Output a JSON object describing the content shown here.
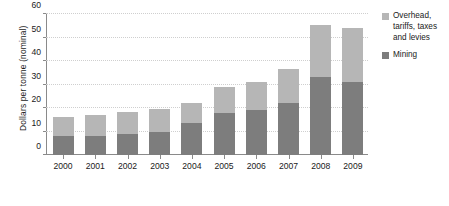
{
  "chart_data": {
    "type": "bar",
    "subtype": "stacked-vertical",
    "title": "",
    "xlabel": "",
    "ylabel": "Dollars per tonne (nominal)",
    "ylim": [
      0,
      60
    ],
    "yticks": [
      0,
      10,
      20,
      30,
      40,
      50,
      60
    ],
    "ytick_labels": [
      "0",
      "10",
      "20",
      "30",
      "40",
      "50",
      "60"
    ],
    "grid": "horizontal-dotted",
    "legend_position": "right",
    "categories": [
      "2000",
      "2001",
      "2002",
      "2003",
      "2004",
      "2005",
      "2006",
      "2007",
      "2008",
      "2009"
    ],
    "series": [
      {
        "name": "Mining",
        "color": "#7d7d7d",
        "values": [
          8,
          8,
          9,
          10,
          13.5,
          18,
          19,
          22,
          33,
          31
        ]
      },
      {
        "name": "Overhead, tariffs, taxes and levies",
        "color": "#b6b6b6",
        "values": [
          8,
          9,
          9.5,
          9.5,
          8.5,
          11,
          12,
          14.5,
          22.5,
          23
        ]
      }
    ],
    "totals": [
      16,
      17,
      18.5,
      19.5,
      22,
      29,
      31,
      36.5,
      55.5,
      54
    ]
  },
  "legend": {
    "items": [
      {
        "label": "Overhead, tariffs, taxes and levies",
        "color": "#b6b6b6"
      },
      {
        "label": "Mining",
        "color": "#7d7d7d"
      }
    ]
  },
  "axes": {
    "y_title": "Dollars per tonne (nominal)"
  }
}
